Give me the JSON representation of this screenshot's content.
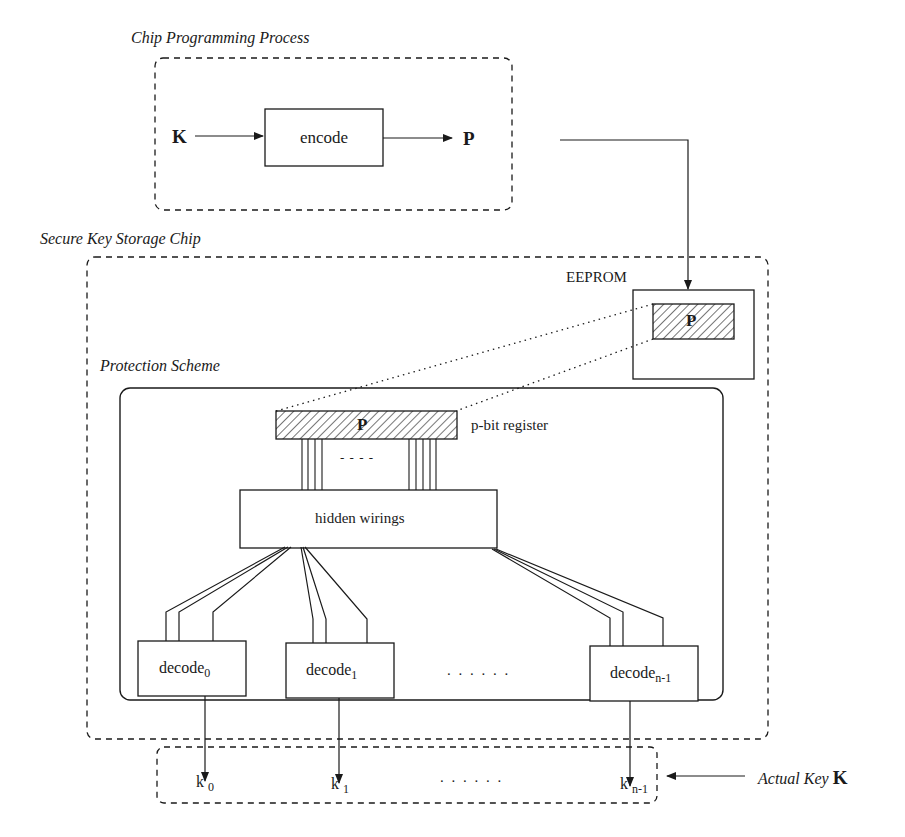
{
  "diagram": {
    "groups": {
      "chip_programming": {
        "title": "Chip Programming Process"
      },
      "secure_chip": {
        "title": "Secure Key Storage Chip"
      },
      "protection": {
        "title": "Protection Scheme"
      },
      "actual_key": {
        "label": "Actual Key",
        "symbol": "K"
      }
    },
    "nodes": {
      "input_key": "K",
      "encode": "encode",
      "output_p": "P",
      "eeprom": "EEPROM",
      "eeprom_p": "P",
      "register_p": "P",
      "register_label": "p-bit register",
      "hidden_wirings": "hidden wirings",
      "wire_ellipsis": "- - - -",
      "decoders": [
        {
          "base": "decode",
          "sub": "0"
        },
        {
          "base": "decode",
          "sub": "1"
        },
        {
          "base": "decode",
          "sub": "n-1"
        }
      ],
      "decoder_ellipsis": ". . . . . .",
      "keys": [
        {
          "base": "k",
          "sub": "0"
        },
        {
          "base": "k",
          "sub": "1"
        },
        {
          "base": "k",
          "sub": "n-1"
        }
      ],
      "key_ellipsis": ". . . . . ."
    },
    "colors": {
      "ink": "#1a1a1a",
      "background": "#ffffff"
    }
  }
}
